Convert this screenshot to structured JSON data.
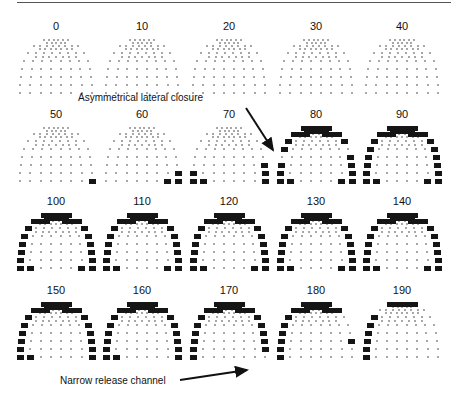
{
  "figure": {
    "panels": [
      {
        "label": "0",
        "x": 14,
        "y": 20,
        "active": []
      },
      {
        "label": "10",
        "x": 100,
        "y": 20,
        "active": []
      },
      {
        "label": "20",
        "x": 187,
        "y": 20,
        "active": []
      },
      {
        "label": "30",
        "x": 274,
        "y": 20,
        "active": []
      },
      {
        "label": "40",
        "x": 360,
        "y": 20,
        "active": []
      },
      {
        "label": "50",
        "x": 14,
        "y": 108,
        "active": [
          "7R"
        ]
      },
      {
        "label": "60",
        "x": 100,
        "y": 108,
        "active": [
          "6R",
          "7R",
          "7Rb"
        ]
      },
      {
        "label": "70",
        "x": 187,
        "y": 108,
        "active": [
          "5R",
          "6R",
          "7R",
          "6L",
          "7L",
          "7Lb"
        ]
      },
      {
        "label": "80",
        "x": 274,
        "y": 108,
        "active": [
          "top",
          "1",
          "2R",
          "2L",
          "3L",
          "4R",
          "5L",
          "5R",
          "6L",
          "6R",
          "7L",
          "7R",
          "7Lb",
          "7Rb"
        ]
      },
      {
        "label": "90",
        "x": 360,
        "y": 108,
        "active": [
          "top",
          "1",
          "2R",
          "2L",
          "3L",
          "3R",
          "4L",
          "4R",
          "5L",
          "5R",
          "6L",
          "6R",
          "7L",
          "7R",
          "7Lb",
          "7Rb"
        ]
      },
      {
        "label": "100",
        "x": 14,
        "y": 195,
        "active": [
          "top",
          "1",
          "2L",
          "2R",
          "3L",
          "3R",
          "4L",
          "4R",
          "5L",
          "5R",
          "6L",
          "6R",
          "7L",
          "7R",
          "7Lb",
          "7Rb"
        ]
      },
      {
        "label": "110",
        "x": 100,
        "y": 195,
        "active": [
          "top",
          "1",
          "2L",
          "2R",
          "3L",
          "3R",
          "4L",
          "4R",
          "5L",
          "5R",
          "6L",
          "6R",
          "7L",
          "7R",
          "7Lb",
          "7Rb"
        ]
      },
      {
        "label": "120",
        "x": 187,
        "y": 195,
        "active": [
          "top",
          "1",
          "2L",
          "2R",
          "3L",
          "3R",
          "4L",
          "4R",
          "5L",
          "5R",
          "6L",
          "6R",
          "7L",
          "7R",
          "7Lb",
          "7Rb"
        ]
      },
      {
        "label": "130",
        "x": 274,
        "y": 195,
        "active": [
          "top",
          "1",
          "2L",
          "2R",
          "3L",
          "3R",
          "4L",
          "4R",
          "5L",
          "5R",
          "6L",
          "6R",
          "7L",
          "7R",
          "7Lb",
          "7Rb"
        ]
      },
      {
        "label": "140",
        "x": 360,
        "y": 195,
        "active": [
          "top",
          "1",
          "2L",
          "2R",
          "3L",
          "3R",
          "4L",
          "4R",
          "5L",
          "5R",
          "6L",
          "6R",
          "7L",
          "7R",
          "7Lb",
          "7Rb"
        ]
      },
      {
        "label": "150",
        "x": 14,
        "y": 284,
        "active": [
          "top",
          "1",
          "2L",
          "2R",
          "3L",
          "3R",
          "4L",
          "4R",
          "5L",
          "5R",
          "6L",
          "6R",
          "7L",
          "7R",
          "7Lb"
        ]
      },
      {
        "label": "160",
        "x": 100,
        "y": 284,
        "active": [
          "top",
          "1",
          "2L",
          "2R",
          "3L",
          "3R",
          "4L",
          "4R",
          "5L",
          "5R",
          "6L",
          "6R",
          "7L",
          "7R",
          "7Lb"
        ]
      },
      {
        "label": "170",
        "x": 187,
        "y": 284,
        "active": [
          "top",
          "1",
          "2L",
          "2R",
          "3L",
          "3R",
          "4L",
          "4R",
          "5L",
          "5R",
          "6L",
          "6R",
          "7L"
        ]
      },
      {
        "label": "180",
        "x": 274,
        "y": 284,
        "active": [
          "top",
          "1",
          "2L",
          "3L",
          "4L",
          "5L",
          "6L",
          "7L",
          "5R"
        ]
      },
      {
        "label": "190",
        "x": 360,
        "y": 284,
        "active": [
          "top1",
          "2L",
          "3L",
          "4L",
          "5L",
          "6L",
          "7L"
        ]
      }
    ],
    "annotations": [
      {
        "text": "Asymmetrical lateral closure",
        "x": 78,
        "y": 92
      },
      {
        "text": "Narrow release channel",
        "x": 60,
        "y": 375
      }
    ],
    "arrows": [
      {
        "x1": 246,
        "y1": 108,
        "x2": 273,
        "y2": 150
      },
      {
        "x1": 180,
        "y1": 380,
        "x2": 247,
        "y2": 370
      }
    ]
  }
}
